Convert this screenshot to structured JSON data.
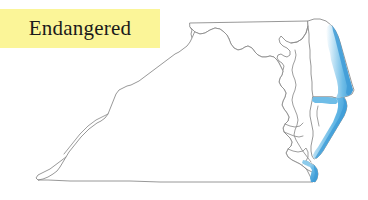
{
  "image": {
    "kind": "thematic-map",
    "width": 368,
    "height": 200,
    "background_color": "#ffffff"
  },
  "legend": {
    "label": "Endangered",
    "highlight_color": "#fbf598",
    "text_color": "#1a1a1a"
  },
  "map": {
    "title": "Endangered",
    "region_name": "Maryland, Delaware and Virginia",
    "outline_color": "#8c8c8c",
    "outline_width": 0.9,
    "fill_color": "#ffffff",
    "highlight_color": "#5cb3e4",
    "highlight_color_light": "#a8d8f0",
    "highlight_color_dark": "#3a97d4",
    "states": [
      {
        "name": "Maryland",
        "highlighted": false
      },
      {
        "name": "Delaware",
        "highlighted": true
      },
      {
        "name": "Virginia",
        "highlighted": true
      }
    ],
    "highlighted_areas": [
      {
        "name": "Delaware Atlantic coast",
        "color": "#5cb3e4"
      },
      {
        "name": "Delmarva Eastern Shore peninsula",
        "color": "#5cb3e4"
      },
      {
        "name": "Virginia Beach / Cape Henry",
        "color": "#5cb3e4"
      }
    ]
  }
}
